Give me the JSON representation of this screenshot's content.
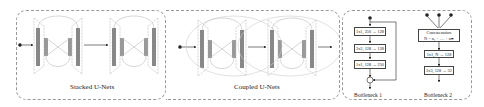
{
  "panels": {
    "stacked": {
      "caption": "Stacked U-Nets"
    },
    "coupled": {
      "caption": "Coupled U-Nets"
    },
    "bottleneck1": {
      "caption": "Bottleneck 1",
      "layers": [
        "1x1, 256 → 128",
        "3x3, 128 → 128",
        "1x1, 128 → 256"
      ],
      "add_symbol": "+"
    },
    "bottleneck2": {
      "caption": "Bottleneck 2",
      "concat_title": "Concatenation",
      "concat_formula": "N = n₁ + … + nₘ",
      "layers": [
        "1x1, N → 128",
        "3x3, 128 → 32"
      ]
    }
  },
  "colors": {
    "bar": "#888888",
    "line": "#aaaaaa",
    "border": "#999999"
  }
}
